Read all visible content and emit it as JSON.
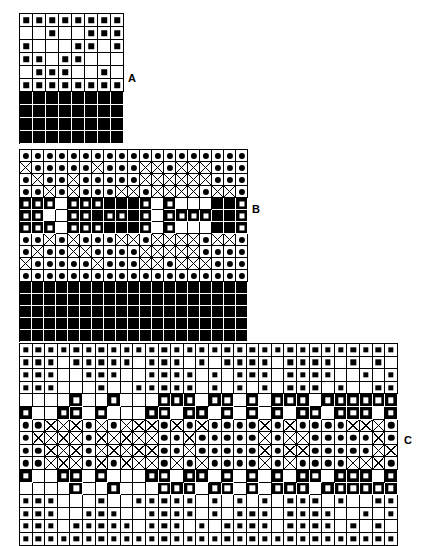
{
  "figure": {
    "title": "",
    "background": "#ffffff",
    "ink": "#000000",
    "panels": [
      {
        "id": "A",
        "label": "A",
        "label_x": 128,
        "label_y": 72,
        "x": 19,
        "y": 13,
        "cell": 13,
        "cols": 8,
        "rows": 10,
        "legend": {
          "square": "open cell with small filled square",
          "filled": "solid black cell"
        },
        "matrix": [
          [
            "s",
            "s",
            "s",
            "s",
            "s",
            "s",
            "s",
            "s"
          ],
          [
            "e",
            "e",
            "s",
            "e",
            "e",
            "s",
            "s",
            "s"
          ],
          [
            "s",
            "e",
            "e",
            "e",
            "s",
            "s",
            "e",
            "s"
          ],
          [
            "s",
            "s",
            "e",
            "s",
            "s",
            "e",
            "e",
            "e"
          ],
          [
            "e",
            "s",
            "s",
            "s",
            "e",
            "e",
            "s",
            "e"
          ],
          [
            "s",
            "s",
            "s",
            "s",
            "s",
            "s",
            "s",
            "s"
          ],
          [
            "f",
            "f",
            "f",
            "f",
            "f",
            "f",
            "f",
            "f"
          ],
          [
            "f",
            "f",
            "f",
            "f",
            "f",
            "f",
            "f",
            "f"
          ],
          [
            "f",
            "f",
            "f",
            "f",
            "f",
            "f",
            "f",
            "f"
          ],
          [
            "f",
            "f",
            "f",
            "f",
            "f",
            "f",
            "f",
            "f"
          ]
        ]
      },
      {
        "id": "B",
        "label": "B",
        "label_x": 252,
        "label_y": 203,
        "x": 19,
        "y": 149,
        "cell": 12,
        "cols": 19,
        "rows": 16,
        "legend": {
          "dot": "open cell with filled circle",
          "x": "open cell with diagonal cross",
          "filled": "solid black cell",
          "white-square": "black cell with white square"
        },
        "matrix": [
          [
            "o",
            "o",
            "o",
            "o",
            "o",
            "o",
            "o",
            "o",
            "o",
            "o",
            "o",
            "o",
            "o",
            "o",
            "o",
            "o",
            "o",
            "o",
            "o"
          ],
          [
            "x",
            "o",
            "o",
            "o",
            "o",
            "o",
            "x",
            "o",
            "o",
            "o",
            "x",
            "x",
            "o",
            "x",
            "x",
            "x",
            "o",
            "o",
            "o"
          ],
          [
            "o",
            "x",
            "o",
            "o",
            "x",
            "o",
            "o",
            "o",
            "o",
            "o",
            "x",
            "x",
            "x",
            "x",
            "x",
            "x",
            "o",
            "o",
            "o"
          ],
          [
            "o",
            "o",
            "x",
            "o",
            "x",
            "o",
            "o",
            "o",
            "x",
            "x",
            "o",
            "x",
            "x",
            "x",
            "x",
            "o",
            "x",
            "x",
            "o"
          ],
          [
            "w",
            "w",
            "w",
            "e",
            "w",
            "w",
            "w",
            "F",
            "F",
            "F",
            "w",
            "e",
            "w",
            "e",
            "e",
            "e",
            "F",
            "F",
            "w"
          ],
          [
            "w",
            "w",
            "e",
            "e",
            "w",
            "w",
            "F",
            "w",
            "w",
            "F",
            "w",
            "e",
            "w",
            "w",
            "w",
            "w",
            "F",
            "F",
            "w"
          ],
          [
            "w",
            "w",
            "w",
            "e",
            "w",
            "w",
            "w",
            "F",
            "F",
            "F",
            "w",
            "e",
            "w",
            "e",
            "e",
            "e",
            "F",
            "F",
            "w"
          ],
          [
            "o",
            "o",
            "x",
            "o",
            "x",
            "o",
            "o",
            "o",
            "x",
            "x",
            "o",
            "x",
            "x",
            "x",
            "x",
            "o",
            "x",
            "x",
            "o"
          ],
          [
            "o",
            "x",
            "o",
            "o",
            "x",
            "x",
            "o",
            "o",
            "o",
            "o",
            "x",
            "x",
            "x",
            "x",
            "x",
            "o",
            "o",
            "o",
            "o"
          ],
          [
            "x",
            "o",
            "o",
            "o",
            "o",
            "o",
            "x",
            "o",
            "o",
            "o",
            "x",
            "x",
            "o",
            "x",
            "x",
            "x",
            "o",
            "o",
            "o"
          ],
          [
            "o",
            "o",
            "o",
            "o",
            "o",
            "o",
            "o",
            "o",
            "o",
            "o",
            "o",
            "o",
            "o",
            "o",
            "o",
            "o",
            "o",
            "o",
            "o"
          ],
          [
            "f",
            "f",
            "f",
            "f",
            "f",
            "f",
            "f",
            "f",
            "f",
            "f",
            "f",
            "f",
            "f",
            "f",
            "f",
            "f",
            "f",
            "f",
            "f"
          ],
          [
            "f",
            "f",
            "f",
            "f",
            "f",
            "f",
            "f",
            "f",
            "f",
            "f",
            "f",
            "f",
            "f",
            "f",
            "f",
            "f",
            "f",
            "f",
            "f"
          ],
          [
            "f",
            "f",
            "f",
            "f",
            "f",
            "f",
            "f",
            "f",
            "f",
            "f",
            "f",
            "f",
            "f",
            "f",
            "f",
            "f",
            "f",
            "f",
            "f"
          ],
          [
            "f",
            "f",
            "f",
            "f",
            "f",
            "f",
            "f",
            "f",
            "f",
            "f",
            "f",
            "f",
            "f",
            "f",
            "f",
            "f",
            "f",
            "f",
            "f"
          ],
          [
            "f",
            "f",
            "f",
            "f",
            "f",
            "f",
            "f",
            "f",
            "f",
            "f",
            "f",
            "f",
            "f",
            "f",
            "f",
            "f",
            "f",
            "f",
            "f"
          ]
        ]
      },
      {
        "id": "C",
        "label": "C",
        "label_x": 404,
        "label_y": 434,
        "x": 19,
        "y": 343,
        "cell": 12.6,
        "cols": 30,
        "rows": 16,
        "legend": {
          "square": "open cell with small filled square",
          "dot": "open cell with filled circle",
          "x": "open cell with diagonal cross",
          "filled": "solid black cell",
          "white-square": "black cell with white square"
        },
        "matrix": [
          [
            "s",
            "s",
            "s",
            "s",
            "s",
            "s",
            "s",
            "s",
            "s",
            "s",
            "s",
            "s",
            "s",
            "s",
            "s",
            "s",
            "s",
            "s",
            "s",
            "s",
            "s",
            "s",
            "s",
            "s",
            "s",
            "s",
            "s",
            "s",
            "s",
            "s"
          ],
          [
            "s",
            "s",
            "s",
            "e",
            "s",
            "s",
            "s",
            "s",
            "s",
            "e",
            "s",
            "s",
            "s",
            "e",
            "s",
            "e",
            "s",
            "s",
            "s",
            "s",
            "e",
            "s",
            "s",
            "s",
            "s",
            "e",
            "s",
            "e",
            "s",
            "e"
          ],
          [
            "s",
            "s",
            "s",
            "e",
            "e",
            "s",
            "s",
            "s",
            "e",
            "e",
            "s",
            "s",
            "s",
            "s",
            "e",
            "s",
            "e",
            "s",
            "s",
            "s",
            "e",
            "s",
            "s",
            "s",
            "s",
            "e",
            "e",
            "s",
            "e",
            "s"
          ],
          [
            "s",
            "s",
            "s",
            "e",
            "e",
            "e",
            "s",
            "e",
            "e",
            "s",
            "s",
            "s",
            "s",
            "s",
            "e",
            "s",
            "e",
            "s",
            "e",
            "s",
            "e",
            "s",
            "s",
            "s",
            "e",
            "s",
            "e",
            "e",
            "s",
            "s"
          ],
          [
            "e",
            "e",
            "e",
            "e",
            "w",
            "e",
            "e",
            "w",
            "e",
            "e",
            "e",
            "w",
            "w",
            "w",
            "e",
            "w",
            "w",
            "e",
            "w",
            "e",
            "w",
            "w",
            "w",
            "e",
            "w",
            "w",
            "w",
            "w",
            "w",
            "w"
          ],
          [
            "w",
            "e",
            "e",
            "w",
            "w",
            "e",
            "w",
            "e",
            "e",
            "e",
            "w",
            "w",
            "e",
            "w",
            "w",
            "e",
            "w",
            "e",
            "w",
            "e",
            "w",
            "e",
            "w",
            "w",
            "e",
            "w",
            "w",
            "w",
            "e",
            "w"
          ],
          [
            "o",
            "o",
            "x",
            "x",
            "x",
            "o",
            "x",
            "o",
            "x",
            "x",
            "x",
            "o",
            "x",
            "o",
            "x",
            "o",
            "o",
            "o",
            "o",
            "x",
            "o",
            "x",
            "o",
            "o",
            "o",
            "o",
            "x",
            "x",
            "x",
            "o"
          ],
          [
            "o",
            "x",
            "x",
            "x",
            "x",
            "o",
            "x",
            "x",
            "x",
            "x",
            "x",
            "o",
            "o",
            "x",
            "o",
            "o",
            "o",
            "o",
            "o",
            "x",
            "o",
            "x",
            "x",
            "o",
            "o",
            "o",
            "o",
            "o",
            "x",
            "o"
          ],
          [
            "o",
            "o",
            "x",
            "x",
            "x",
            "o",
            "x",
            "x",
            "x",
            "x",
            "x",
            "o",
            "o",
            "x",
            "o",
            "o",
            "o",
            "o",
            "o",
            "x",
            "o",
            "x",
            "x",
            "o",
            "o",
            "o",
            "o",
            "o",
            "x",
            "x"
          ],
          [
            "o",
            "o",
            "x",
            "x",
            "x",
            "o",
            "x",
            "o",
            "x",
            "x",
            "x",
            "o",
            "x",
            "o",
            "x",
            "o",
            "o",
            "o",
            "o",
            "x",
            "o",
            "x",
            "o",
            "o",
            "o",
            "o",
            "x",
            "x",
            "x",
            "o"
          ],
          [
            "w",
            "e",
            "e",
            "w",
            "w",
            "e",
            "w",
            "e",
            "e",
            "e",
            "w",
            "w",
            "e",
            "w",
            "w",
            "e",
            "w",
            "e",
            "w",
            "e",
            "w",
            "e",
            "w",
            "w",
            "e",
            "w",
            "w",
            "w",
            "e",
            "w"
          ],
          [
            "e",
            "e",
            "e",
            "e",
            "w",
            "e",
            "e",
            "w",
            "e",
            "e",
            "e",
            "w",
            "w",
            "w",
            "e",
            "w",
            "w",
            "e",
            "w",
            "e",
            "w",
            "w",
            "w",
            "e",
            "w",
            "w",
            "w",
            "w",
            "w",
            "w"
          ],
          [
            "s",
            "s",
            "s",
            "e",
            "e",
            "e",
            "s",
            "e",
            "e",
            "s",
            "s",
            "s",
            "s",
            "s",
            "e",
            "s",
            "e",
            "s",
            "e",
            "s",
            "e",
            "s",
            "s",
            "s",
            "e",
            "s",
            "e",
            "e",
            "s",
            "s"
          ],
          [
            "s",
            "s",
            "s",
            "e",
            "e",
            "s",
            "s",
            "s",
            "e",
            "e",
            "s",
            "s",
            "s",
            "s",
            "e",
            "s",
            "e",
            "s",
            "s",
            "s",
            "e",
            "s",
            "s",
            "s",
            "s",
            "e",
            "e",
            "s",
            "e",
            "s"
          ],
          [
            "s",
            "s",
            "s",
            "e",
            "s",
            "s",
            "s",
            "s",
            "s",
            "e",
            "s",
            "s",
            "s",
            "e",
            "s",
            "e",
            "s",
            "s",
            "s",
            "s",
            "e",
            "s",
            "s",
            "s",
            "s",
            "e",
            "s",
            "e",
            "s",
            "e"
          ],
          [
            "s",
            "s",
            "s",
            "s",
            "s",
            "s",
            "s",
            "s",
            "s",
            "s",
            "s",
            "s",
            "s",
            "s",
            "s",
            "s",
            "s",
            "s",
            "s",
            "s",
            "s",
            "s",
            "s",
            "s",
            "s",
            "s",
            "s",
            "s",
            "s",
            "s"
          ]
        ]
      }
    ]
  }
}
